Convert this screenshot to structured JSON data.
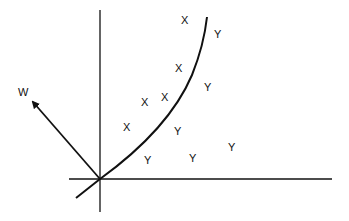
{
  "diagram": {
    "colors": {
      "ink": "#111111",
      "background": "#ffffff"
    },
    "vector_label": "W",
    "class_x_label": "X",
    "class_y_label": "Y",
    "points": [
      {
        "cls": "X"
      },
      {
        "cls": "X"
      },
      {
        "cls": "X"
      },
      {
        "cls": "X"
      },
      {
        "cls": "X"
      },
      {
        "cls": "Y"
      },
      {
        "cls": "Y"
      },
      {
        "cls": "Y"
      },
      {
        "cls": "Y"
      },
      {
        "cls": "Y"
      },
      {
        "cls": "Y"
      }
    ]
  }
}
